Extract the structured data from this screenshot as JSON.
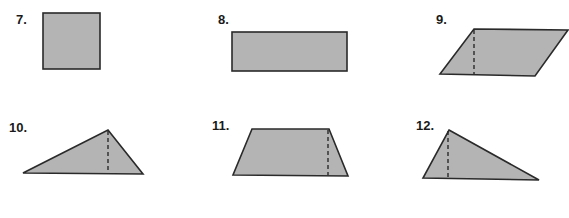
{
  "problems": [
    {
      "number": "7.",
      "shape": "square",
      "label_pos": [
        16,
        13
      ]
    },
    {
      "number": "8.",
      "shape": "rectangle",
      "label_pos": [
        218,
        13
      ]
    },
    {
      "number": "9.",
      "shape": "parallelogram",
      "label_pos": [
        436,
        13
      ]
    },
    {
      "number": "10.",
      "shape": "triangle",
      "label_pos": [
        9,
        121
      ]
    },
    {
      "number": "11.",
      "shape": "trapezoid",
      "label_pos": [
        212,
        119
      ]
    },
    {
      "number": "12.",
      "shape": "right-triangle",
      "label_pos": [
        416,
        119
      ]
    }
  ],
  "colors": {
    "fill": "#b4b4b4",
    "stroke": "#2a2a2a"
  }
}
